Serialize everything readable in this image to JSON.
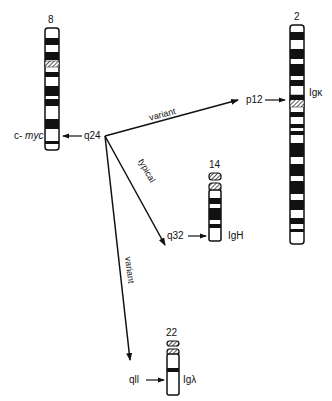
{
  "chromosomes": [
    {
      "id": "chr8",
      "number": "8",
      "band": "q24",
      "gene_prefix": "c- ",
      "gene": "myc"
    },
    {
      "id": "chr2",
      "number": "2",
      "band": "p12",
      "gene": "Igκ"
    },
    {
      "id": "chr14",
      "number": "14",
      "band": "q32",
      "gene": "IgH"
    },
    {
      "id": "chr22",
      "number": "22",
      "band": "qll",
      "gene": "Igλ"
    }
  ],
  "translocations": [
    {
      "label": "variant",
      "from": "8q24",
      "to": "2p12"
    },
    {
      "label": "typical",
      "from": "8q24",
      "to": "14q32"
    },
    {
      "label": "variant",
      "from": "8q24",
      "to": "22q11"
    }
  ],
  "colors": {
    "ink": "#111111",
    "background": "#ffffff"
  }
}
